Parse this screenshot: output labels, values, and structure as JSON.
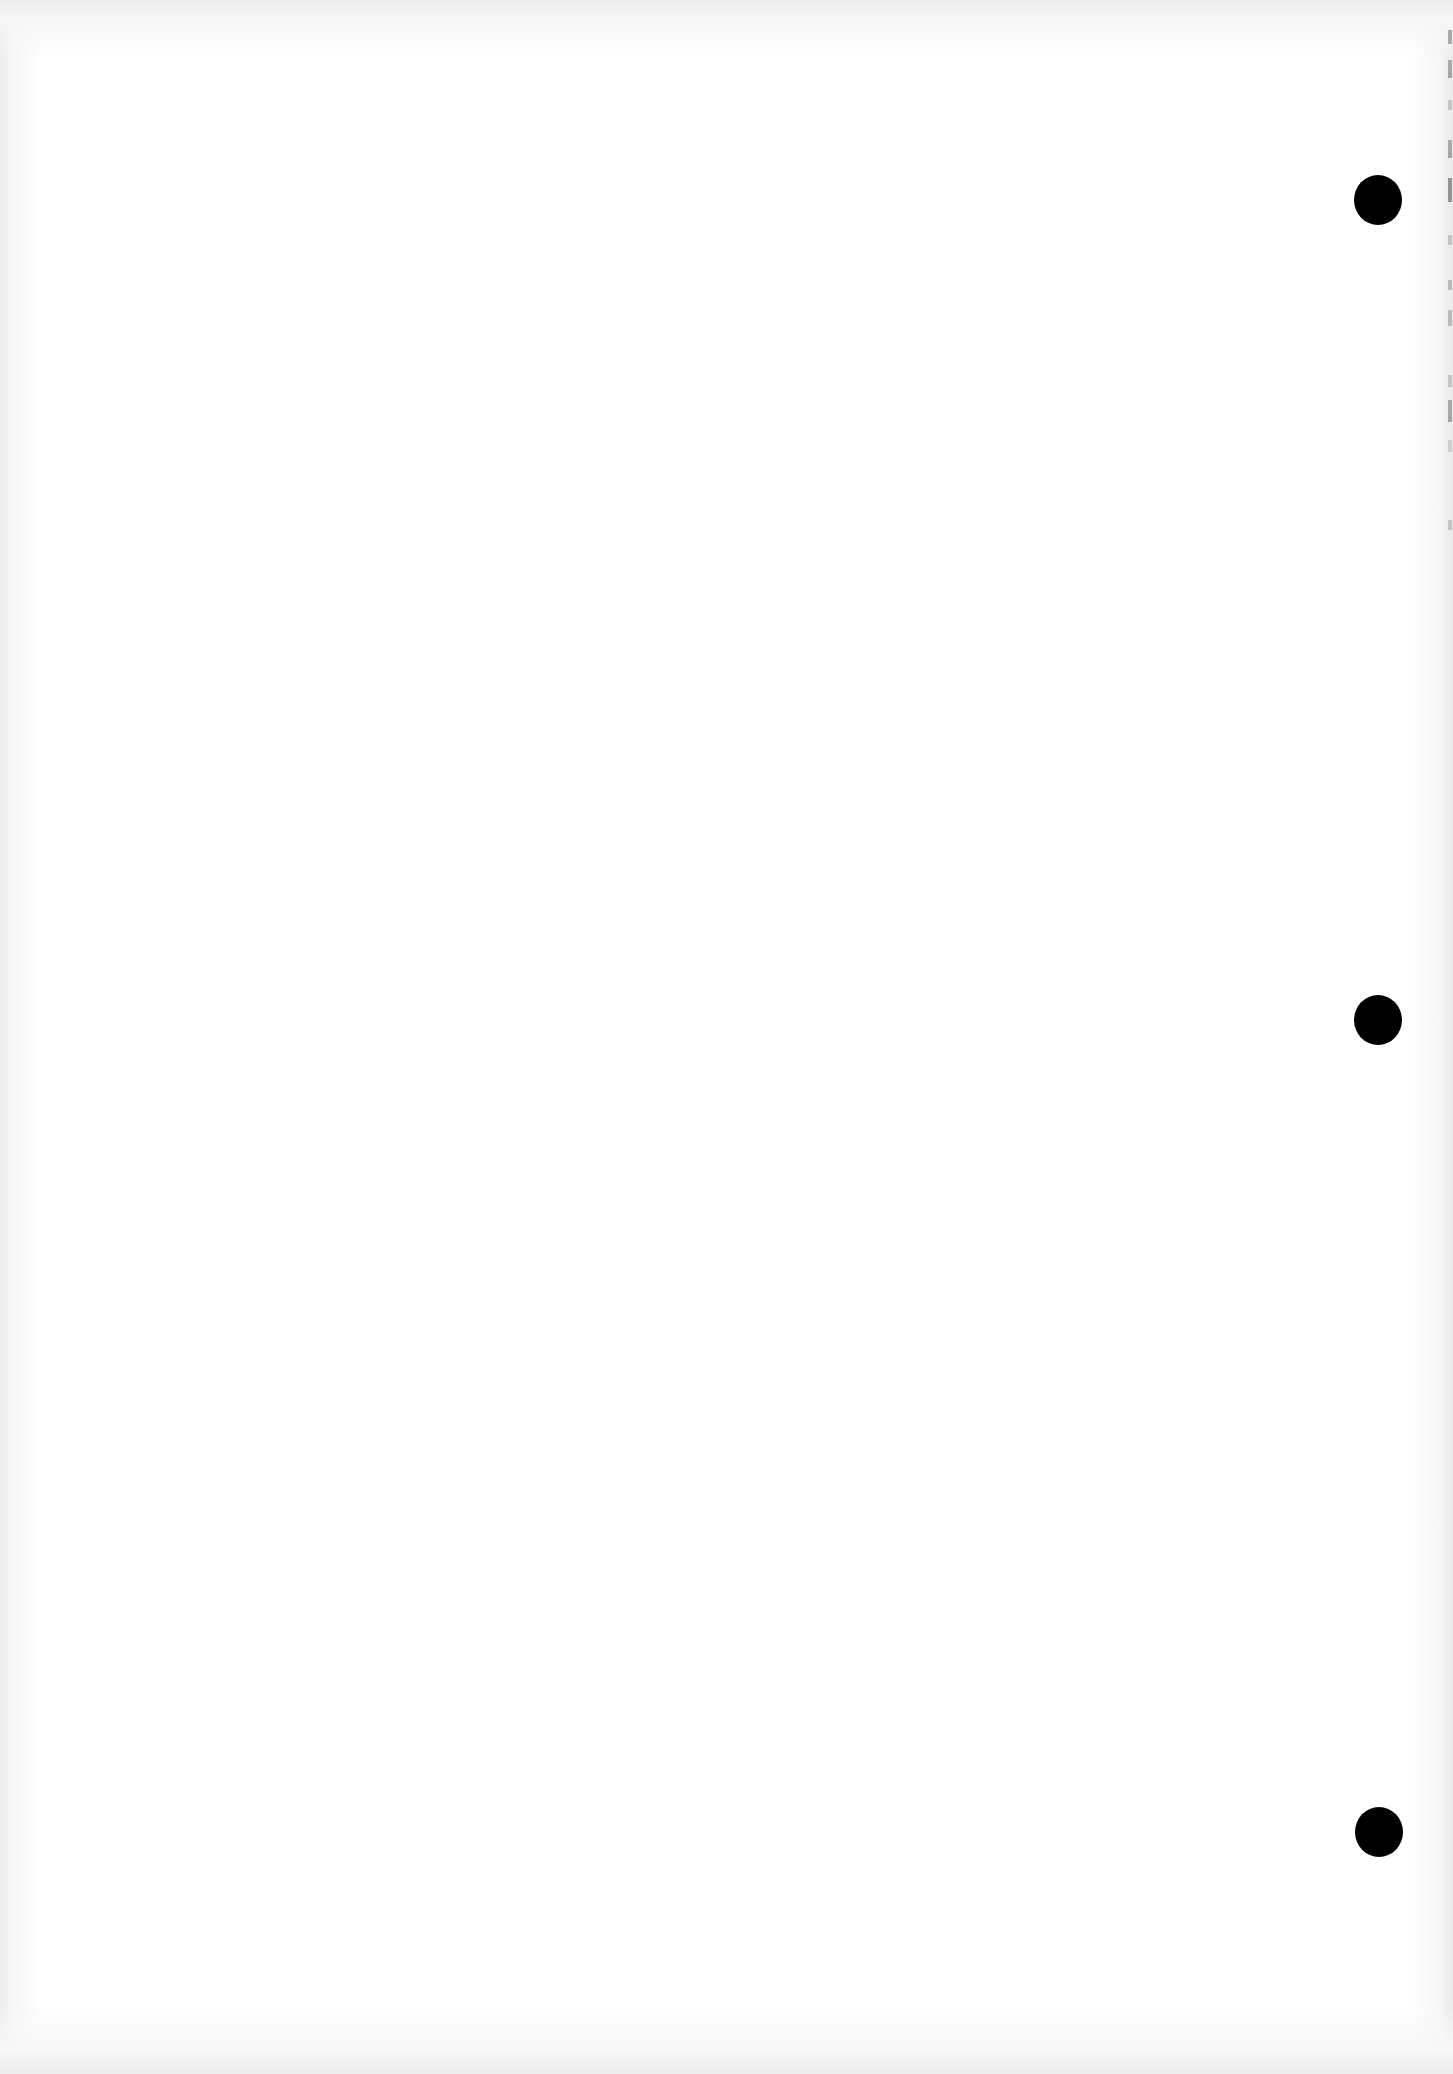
{
  "document": {
    "type": "blank scanned sheet",
    "background_color": "#ffffff",
    "punch_holes": [
      {
        "name": "top",
        "x": 1378,
        "y": 200,
        "diameter": 48
      },
      {
        "name": "middle",
        "x": 1378,
        "y": 1020,
        "diameter": 48
      },
      {
        "name": "bottom",
        "x": 1379,
        "y": 1832,
        "diameter": 48
      }
    ],
    "hole_color": "#000000",
    "text_content": ""
  }
}
